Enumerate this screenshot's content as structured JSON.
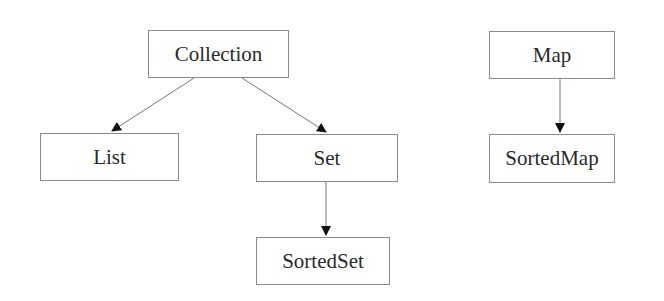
{
  "diagram": {
    "nodes": [
      {
        "id": "collection",
        "label": "Collection"
      },
      {
        "id": "list",
        "label": "List"
      },
      {
        "id": "set",
        "label": "Set"
      },
      {
        "id": "sortedset",
        "label": "SortedSet"
      },
      {
        "id": "map",
        "label": "Map"
      },
      {
        "id": "sortedmap",
        "label": "SortedMap"
      }
    ],
    "edges": [
      {
        "from": "collection",
        "to": "list"
      },
      {
        "from": "collection",
        "to": "set"
      },
      {
        "from": "set",
        "to": "sortedset"
      },
      {
        "from": "map",
        "to": "sortedmap"
      }
    ]
  }
}
